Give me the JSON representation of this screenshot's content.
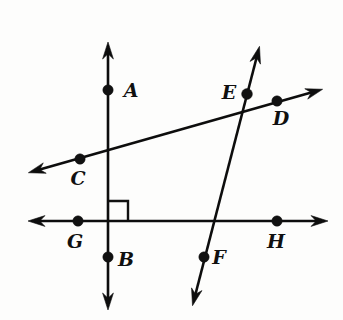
{
  "figure": {
    "background_color": "#fdfdfc",
    "stroke_color": "#0d0d0d",
    "width": 343,
    "height": 320
  },
  "labels": [
    {
      "id": "A",
      "text": "A",
      "x": 131,
      "y": 92
    },
    {
      "id": "B",
      "text": "B",
      "x": 126,
      "y": 261
    },
    {
      "id": "C",
      "text": "C",
      "x": 78,
      "y": 180
    },
    {
      "id": "D",
      "text": "D",
      "x": 281,
      "y": 120
    },
    {
      "id": "E",
      "text": "E",
      "x": 229,
      "y": 94
    },
    {
      "id": "F",
      "text": "F",
      "x": 219,
      "y": 259
    },
    {
      "id": "G",
      "text": "G",
      "x": 75,
      "y": 243
    },
    {
      "id": "H",
      "text": "H",
      "x": 276,
      "y": 243
    }
  ],
  "points": [
    {
      "id": "A",
      "x": 108,
      "y": 90,
      "r": 5.2
    },
    {
      "id": "B",
      "x": 108,
      "y": 257,
      "r": 5.2
    },
    {
      "id": "C",
      "x": 80,
      "y": 159,
      "r": 5.2
    },
    {
      "id": "D",
      "x": 277,
      "y": 101,
      "r": 5.2
    },
    {
      "id": "E",
      "x": 247,
      "y": 94,
      "r": 5.4
    },
    {
      "id": "F",
      "x": 204,
      "y": 257,
      "r": 5.2
    },
    {
      "id": "G",
      "x": 78,
      "y": 221,
      "r": 5.2
    },
    {
      "id": "H",
      "x": 277,
      "y": 221,
      "r": 5.2
    }
  ],
  "lines": [
    {
      "id": "line-AB",
      "name": "vertical-line-ab",
      "description": "Vertical double-headed line through A and B",
      "x1": 108,
      "y1": 52,
      "x2": 108,
      "y2": 300,
      "arrow_start": true,
      "arrow_end": true
    },
    {
      "id": "line-GH",
      "name": "horizontal-line-gh",
      "description": "Horizontal double-headed line through G and H",
      "x1": 38,
      "y1": 221,
      "x2": 318,
      "y2": 221,
      "arrow_start": true,
      "arrow_end": true
    },
    {
      "id": "line-CD",
      "name": "transversal-line-cd",
      "description": "Shallow rising double-headed line through C, E and D",
      "x1": 38,
      "y1": 170,
      "x2": 313,
      "y2": 92,
      "arrow_start": true,
      "arrow_end": true
    },
    {
      "id": "line-EF",
      "name": "transversal-line-ef",
      "description": "Steep double-headed line through E and F",
      "x1": 257,
      "y1": 56,
      "x2": 195,
      "y2": 296,
      "arrow_start": true,
      "arrow_end": true
    }
  ],
  "right_angle": {
    "id": "right-angle-marker",
    "description": "Right angle square at the intersection of line AB and line GH",
    "corner_x": 109,
    "corner_y": 220,
    "size": 19
  },
  "intersections": [
    {
      "id": "AB-GH",
      "x": 108,
      "y": 221,
      "angle": "90"
    },
    {
      "id": "AB-CD",
      "x": 108,
      "y": 153
    },
    {
      "id": "CD-EF",
      "x": 247,
      "y": 94
    },
    {
      "id": "EF-GH",
      "x": 213,
      "y": 221
    }
  ]
}
